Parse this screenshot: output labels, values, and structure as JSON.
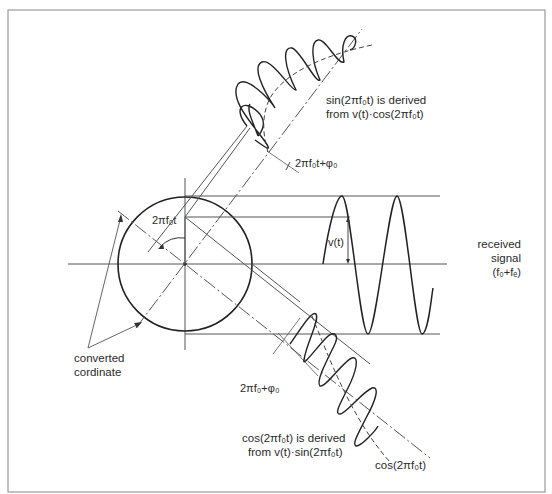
{
  "diagram": {
    "title": "",
    "labels": {
      "sin_derived_line1": "sin(2πf₀t) is derived",
      "sin_derived_line2": "from v(t)·cos(2πf₀t)",
      "phase_upper": "2πf₀t+φ₀",
      "angle": "2πf₀t",
      "vt": "v(t)",
      "received_line1": "received",
      "received_line2": "signal",
      "received_line3": "(f₀+fₑ)",
      "converted_line1": "converted",
      "converted_line2": "cordinate",
      "phase_lower": "2πf₀+φ₀",
      "cos_derived_line1": "cos(2πf₀t) is derived",
      "cos_derived_line2": "from v(t)·sin(2πf₀t)",
      "cos_ref": "cos(2πf₀t)"
    },
    "colors": {
      "ink": "#2a2a2a",
      "thin": "#5a5a5a",
      "frame": "#9a9a9a",
      "background": "#ffffff"
    },
    "elements": [
      "reference-circle",
      "horizontal-axis",
      "vertical-axis",
      "rotated-coordinate-axes",
      "received-sine-wave",
      "upper-projected-wave",
      "lower-projected-wave",
      "converted-coordinate-arrows",
      "angle-arc-arrow"
    ]
  }
}
